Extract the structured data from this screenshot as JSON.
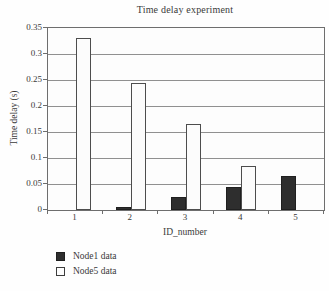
{
  "chart_data": {
    "type": "bar",
    "title": "Time delay experiment",
    "xlabel": "ID_number",
    "ylabel": "Time delay (s)",
    "categories": [
      "1",
      "2",
      "3",
      "4",
      "5"
    ],
    "series": [
      {
        "name": "Node1 data",
        "swatch": "filled-dark-square",
        "color": "#2e2e2e",
        "values": [
          0,
          0.005,
          0.025,
          0.045,
          0.065
        ]
      },
      {
        "name": "Node5 data",
        "swatch": "open-white-square",
        "color": "#fcfcfc",
        "values": [
          0.33,
          0.245,
          0.165,
          0.085,
          0
        ]
      }
    ],
    "ylim": [
      0,
      0.35
    ],
    "ytick_values": [
      0,
      0.05,
      0.1,
      0.15,
      0.2,
      0.25,
      0.3,
      0.35
    ],
    "ytick_labels": [
      "0",
      "0.05",
      "0.1",
      "0.15",
      "0.2",
      "0.25",
      "0.3",
      "0.35"
    ],
    "grid": "horizontal gridlines every 0.05, boxed plot area",
    "legend_position": "below-left",
    "bar_layout": "paired bars per category: dark bar left of tick center, white bar right of tick center"
  },
  "colors": {
    "background": "#fefefe",
    "axis_and_box": "#6e6e6e",
    "gridline": "#909090",
    "text": "#3a3a3a",
    "bar_dark": "#2e2e2e",
    "bar_light": "#fcfcfc"
  }
}
